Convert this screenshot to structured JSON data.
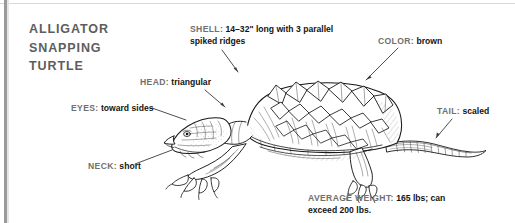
{
  "title": {
    "lines": [
      "ALLIGATOR",
      "SNAPPING",
      "TURTLE"
    ],
    "color": "#5d5d5d"
  },
  "illustration": {
    "subject": "alligator-snapping-turtle",
    "style": "pen-and-ink line engraving",
    "orientation": "facing left, side profile",
    "ink_color": "#1a1a1a"
  },
  "callouts": [
    {
      "id": "shell",
      "key": "SHELL:",
      "value": "14–32\" long with 3 parallel spiked ridges"
    },
    {
      "id": "color",
      "key": "COLOR:",
      "value": "brown"
    },
    {
      "id": "head",
      "key": "HEAD:",
      "value": "triangular"
    },
    {
      "id": "eyes",
      "key": "EYES:",
      "value": "toward sides"
    },
    {
      "id": "neck",
      "key": "NECK:",
      "value": "short"
    },
    {
      "id": "tail",
      "key": "TAIL:",
      "value": "scaled"
    },
    {
      "id": "weight",
      "key": "AVERAGE WEIGHT:",
      "value": "165 lbs; can exceed 200 lbs."
    }
  ],
  "colors": {
    "background": "#ffffff",
    "key_text": "#6f6f6f",
    "value_text": "#141414",
    "leader_line": "#3a3a3a",
    "border_bar": "#9a9a9a",
    "top_rule": "#d8d8d8"
  }
}
